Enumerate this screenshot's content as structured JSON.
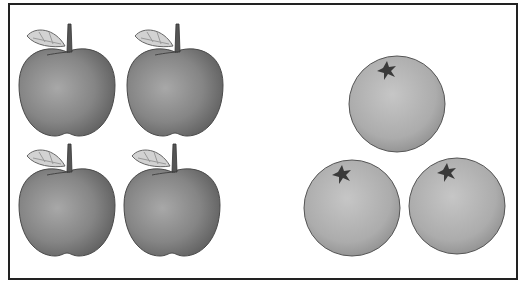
{
  "scene": {
    "description": "Four apples and three oranges",
    "groups": [
      {
        "name": "apples",
        "count": 4
      },
      {
        "name": "oranges",
        "count": 3
      }
    ]
  },
  "colors": {
    "border": "#222222",
    "apple_fill": "#7d7d7d",
    "apple_highlight": "#a8a8a8",
    "leaf": "#cfcfcf",
    "stem": "#555555",
    "orange_fill": "#a9a9a9",
    "orange_highlight": "#c4c4c4",
    "calyx": "#3a3a3a"
  }
}
